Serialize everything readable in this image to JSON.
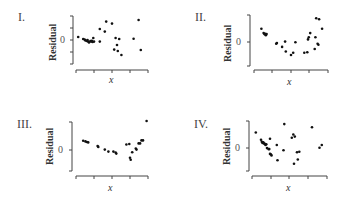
{
  "chart_data": [
    {
      "type": "scatter",
      "title": "I.",
      "xlabel": "x",
      "ylabel": "Residual",
      "ytick_label": "0",
      "grid": false,
      "description": "Random scatter, spread increasing with x",
      "points": [
        [
          0.03,
          0.15
        ],
        [
          0.1,
          0.05
        ],
        [
          0.12,
          0.02
        ],
        [
          0.13,
          -0.02
        ],
        [
          0.15,
          -0.05
        ],
        [
          0.16,
          0.0
        ],
        [
          0.17,
          -0.08
        ],
        [
          0.18,
          -0.12
        ],
        [
          0.2,
          -0.05
        ],
        [
          0.21,
          -0.08
        ],
        [
          0.22,
          -0.04
        ],
        [
          0.23,
          -0.1
        ],
        [
          0.24,
          0.1
        ],
        [
          0.25,
          -0.08
        ],
        [
          0.33,
          0.55
        ],
        [
          0.33,
          -0.08
        ],
        [
          0.42,
          0.92
        ],
        [
          0.4,
          0.42
        ],
        [
          0.5,
          0.82
        ],
        [
          0.53,
          -0.48
        ],
        [
          0.55,
          0.1
        ],
        [
          0.57,
          -0.25
        ],
        [
          0.58,
          -0.55
        ],
        [
          0.6,
          0.05
        ],
        [
          0.63,
          -0.75
        ],
        [
          0.8,
          0.06
        ],
        [
          0.87,
          1.0
        ],
        [
          0.9,
          -0.5
        ]
      ]
    },
    {
      "type": "scatter",
      "title": "II.",
      "xlabel": "x",
      "ylabel": "Residual",
      "ytick_label": "0",
      "grid": false,
      "description": "U-shaped (curved) pattern",
      "points": [
        [
          0.1,
          0.55
        ],
        [
          0.13,
          0.35
        ],
        [
          0.14,
          0.3
        ],
        [
          0.15,
          0.32
        ],
        [
          0.16,
          0.25
        ],
        [
          0.17,
          0.3
        ],
        [
          0.3,
          -0.15
        ],
        [
          0.31,
          -0.12
        ],
        [
          0.38,
          -0.3
        ],
        [
          0.42,
          -0.05
        ],
        [
          0.43,
          -0.52
        ],
        [
          0.5,
          -0.68
        ],
        [
          0.53,
          -0.58
        ],
        [
          0.56,
          -0.08
        ],
        [
          0.68,
          -0.58
        ],
        [
          0.72,
          -0.55
        ],
        [
          0.73,
          0.05
        ],
        [
          0.74,
          0.15
        ],
        [
          0.76,
          0.35
        ],
        [
          0.82,
          -0.4
        ],
        [
          0.83,
          0.15
        ],
        [
          0.86,
          -0.15
        ],
        [
          0.87,
          -0.2
        ],
        [
          0.84,
          1.05
        ],
        [
          0.88,
          1.0
        ],
        [
          0.92,
          0.55
        ]
      ]
    },
    {
      "type": "scatter",
      "title": "III.",
      "xlabel": "x",
      "ylabel": "Residual",
      "ytick_label": "0",
      "grid": false,
      "description": "Curved pattern with increasing spread and one high outlier",
      "points": [
        [
          0.1,
          0.28
        ],
        [
          0.13,
          0.25
        ],
        [
          0.15,
          0.22
        ],
        [
          0.17,
          0.2
        ],
        [
          0.3,
          0.02
        ],
        [
          0.31,
          -0.02
        ],
        [
          0.4,
          -0.15
        ],
        [
          0.45,
          -0.25
        ],
        [
          0.52,
          -0.25
        ],
        [
          0.55,
          -0.3
        ],
        [
          0.56,
          -0.35
        ],
        [
          0.7,
          0.1
        ],
        [
          0.74,
          0.12
        ],
        [
          0.75,
          -0.55
        ],
        [
          0.76,
          -0.65
        ],
        [
          0.78,
          -0.28
        ],
        [
          0.83,
          -0.1
        ],
        [
          0.84,
          -0.15
        ],
        [
          0.87,
          0.15
        ],
        [
          0.89,
          0.15
        ],
        [
          0.91,
          0.3
        ],
        [
          0.93,
          0.3
        ],
        [
          0.98,
          1.25
        ]
      ]
    },
    {
      "type": "scatter",
      "title": "IV.",
      "xlabel": "x",
      "ylabel": "Residual",
      "ytick_label": "0",
      "grid": false,
      "description": "Scatter with downward trend on left and random spread on right",
      "points": [
        [
          0.05,
          0.65
        ],
        [
          0.12,
          0.3
        ],
        [
          0.13,
          0.2
        ],
        [
          0.14,
          0.15
        ],
        [
          0.15,
          0.18
        ],
        [
          0.16,
          0.12
        ],
        [
          0.17,
          0.1
        ],
        [
          0.18,
          0.05
        ],
        [
          0.19,
          0.08
        ],
        [
          0.2,
          -0.1
        ],
        [
          0.22,
          -0.15
        ],
        [
          0.23,
          -0.15
        ],
        [
          0.24,
          -0.38
        ],
        [
          0.25,
          -0.4
        ],
        [
          0.26,
          -0.45
        ],
        [
          0.24,
          0.35
        ],
        [
          0.33,
          0.05
        ],
        [
          0.34,
          -0.68
        ],
        [
          0.42,
          -0.2
        ],
        [
          0.43,
          1.05
        ],
        [
          0.53,
          0.4
        ],
        [
          0.55,
          0.55
        ],
        [
          0.56,
          -0.85
        ],
        [
          0.57,
          0.45
        ],
        [
          0.6,
          -0.3
        ],
        [
          0.61,
          -0.65
        ],
        [
          0.63,
          -0.28
        ],
        [
          0.8,
          0.9
        ],
        [
          0.9,
          -0.08
        ],
        [
          0.93,
          0.05
        ]
      ]
    }
  ],
  "panels": [
    {
      "roman": "I.",
      "ylabel": "Residual",
      "zero": "0",
      "xlabel": "x"
    },
    {
      "roman": "II.",
      "ylabel": "Residual",
      "zero": "0",
      "xlabel": "x"
    },
    {
      "roman": "III.",
      "ylabel": "Residual",
      "zero": "0",
      "xlabel": "x"
    },
    {
      "roman": "IV.",
      "ylabel": "Residual",
      "zero": "0",
      "xlabel": "x"
    }
  ],
  "colors": {
    "axis": "#444444",
    "point": "#111111",
    "text": "#333333"
  }
}
